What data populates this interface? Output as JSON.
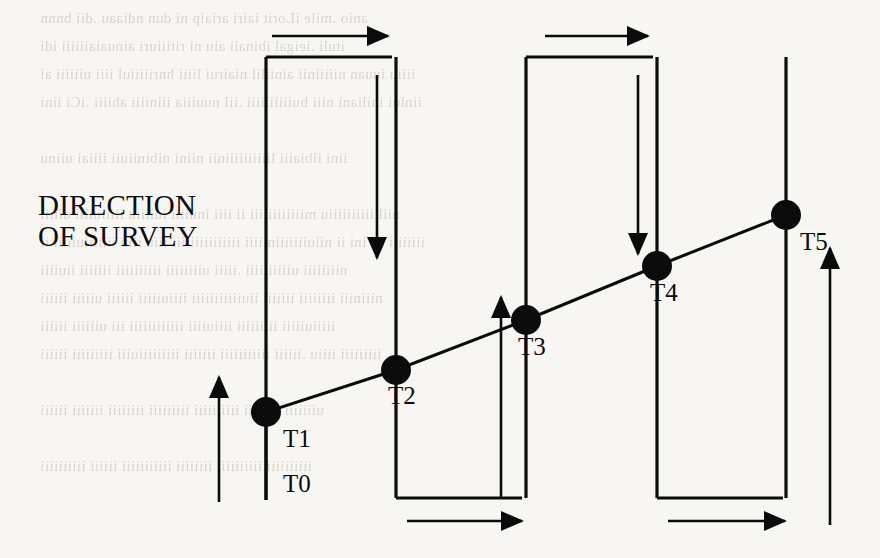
{
  "figure": {
    "caption": "DIRECTION\nOF SURVEY",
    "caption_lines": [
      "DIRECTION",
      "OF SURVEY"
    ],
    "ink_color": "#0b0b0b",
    "paper_color": "#f7f6f3"
  },
  "chart_data": {
    "type": "line",
    "title": "DIRECTION OF SURVEY",
    "xlabel": "",
    "ylabel": "",
    "grid": false,
    "legend": false,
    "x": [
      219,
      266,
      396,
      526,
      657,
      786
    ],
    "y": [
      500,
      412,
      370,
      320,
      266,
      215
    ],
    "point_labels": [
      "T0",
      "T1",
      "T2",
      "T3",
      "T4",
      "T5"
    ],
    "series": [
      {
        "name": "survey trend line",
        "points": [
          {
            "label": "T0",
            "x": 266,
            "y": 500,
            "marker": false
          },
          {
            "label": "T1",
            "x": 266,
            "y": 412,
            "marker": true
          },
          {
            "label": "T2",
            "x": 396,
            "y": 370,
            "marker": true
          },
          {
            "label": "T3",
            "x": 526,
            "y": 320,
            "marker": true
          },
          {
            "label": "T4",
            "x": 657,
            "y": 266,
            "marker": true
          },
          {
            "label": "T5",
            "x": 786,
            "y": 215,
            "marker": true
          }
        ]
      }
    ],
    "marker_style": "filled-circle",
    "marker_radius": 15
  },
  "stations": [
    {
      "id": "T0",
      "label": "T0",
      "x": 266,
      "y": 500,
      "label_x": 283,
      "label_y": 470,
      "has_marker": false
    },
    {
      "id": "T1",
      "label": "T1",
      "x": 266,
      "y": 412,
      "label_x": 283,
      "label_y": 425,
      "has_marker": true
    },
    {
      "id": "T2",
      "label": "T2",
      "x": 396,
      "y": 370,
      "label_x": 388,
      "label_y": 382,
      "has_marker": true
    },
    {
      "id": "T3",
      "label": "T3",
      "x": 526,
      "y": 320,
      "label_x": 518,
      "label_y": 333,
      "has_marker": true
    },
    {
      "id": "T4",
      "label": "T4",
      "x": 657,
      "y": 266,
      "label_x": 650,
      "label_y": 279,
      "has_marker": true
    },
    {
      "id": "T5",
      "label": "T5",
      "x": 786,
      "y": 215,
      "label_x": 800,
      "label_y": 228,
      "has_marker": true
    }
  ],
  "track_lines": [
    {
      "name": "track-line-1",
      "x": 266,
      "y_top": 57,
      "y_bottom": 500
    },
    {
      "name": "track-line-2",
      "x": 396,
      "y_top": 57,
      "y_bottom": 498
    },
    {
      "name": "track-line-3",
      "x": 526,
      "y_top": 57,
      "y_bottom": 498
    },
    {
      "name": "track-line-4",
      "x": 657,
      "y_top": 57,
      "y_bottom": 498
    },
    {
      "name": "track-line-5",
      "x": 786,
      "y_top": 57,
      "y_bottom": 498
    }
  ],
  "turn_segments": [
    {
      "name": "top-turn-1",
      "x1": 266,
      "x2": 392,
      "y": 57
    },
    {
      "name": "bottom-turn-1",
      "x1": 396,
      "x2": 522,
      "y": 498
    },
    {
      "name": "top-turn-2",
      "x1": 526,
      "x2": 653,
      "y": 57
    },
    {
      "name": "bottom-turn-2",
      "x1": 657,
      "x2": 783,
      "y": 498
    }
  ],
  "direction_arrows": [
    {
      "name": "arrow-top-right-1",
      "direction": "right",
      "x1": 272,
      "y1": 36,
      "x2": 388,
      "y2": 36
    },
    {
      "name": "arrow-top-right-2",
      "direction": "right",
      "x1": 545,
      "y1": 36,
      "x2": 648,
      "y2": 36
    },
    {
      "name": "arrow-down-1",
      "direction": "down",
      "x1": 377,
      "y1": 75,
      "x2": 377,
      "y2": 258
    },
    {
      "name": "arrow-down-2",
      "direction": "down",
      "x1": 638,
      "y1": 75,
      "x2": 638,
      "y2": 254
    },
    {
      "name": "arrow-up-1",
      "direction": "up",
      "x1": 219,
      "y1": 502,
      "x2": 219,
      "y2": 377
    },
    {
      "name": "arrow-up-2",
      "direction": "up",
      "x1": 501,
      "y1": 497,
      "x2": 501,
      "y2": 297
    },
    {
      "name": "arrow-up-3",
      "direction": "up",
      "x1": 830,
      "y1": 525,
      "x2": 830,
      "y2": 248
    },
    {
      "name": "arrow-bottom-right-1",
      "direction": "right",
      "x1": 407,
      "y1": 521,
      "x2": 522,
      "y2": 521
    },
    {
      "name": "arrow-bottom-right-2",
      "direction": "right",
      "x1": 668,
      "y1": 521,
      "x2": 785,
      "y2": 521
    }
  ],
  "bleed_through_text": [
    {
      "text": "anio .mile iLorit iairi ariaip ni dun ndiaau .dii bnnn",
      "x": 40,
      "y": 10,
      "size": 15
    },
    {
      "text": "ituli .ieigal ibinaii aiu ni ritiiiuri ainuaiaiiiiii idi",
      "x": 40,
      "y": 38,
      "size": 15
    },
    {
      "text": "iiiiu iuuan niiiiinii ainiilil niairui liiii hnriiiiiul iiii uiiiiii ai",
      "x": 40,
      "y": 66,
      "size": 15
    },
    {
      "text": "iinlui iniliani niii buiiiiiiiiii .iiI nuuiiia iiiniiii ahiiii .iCi iini",
      "x": 40,
      "y": 94,
      "size": 15
    },
    {
      "text": "iini ilbiaiii liiiiiiiiiinii niini nibiniiuii iiiiai uiinu",
      "x": 40,
      "y": 150,
      "size": 15
    },
    {
      "text": "niil iiiiiiiiiiu miiiiiiiiiiii ii iiii inuiiii iuiiiiu iiiiiuiiii uiiiii",
      "x": 40,
      "y": 206,
      "size": 15
    },
    {
      "text": "iiiiiiii iii ini ii niiuiiiiiiiniiiii iiiiiiiiiiiiiii iiiu iiiu iiiiiiiuiiiii ii",
      "x": 40,
      "y": 234,
      "size": 15
    },
    {
      "text": "niiiiiiii uiiiiiiiiii .iiiii uiiiiiiii iiiiiiiiii iiiiiii iiuiiii",
      "x": 40,
      "y": 262,
      "size": 15
    },
    {
      "text": "niiiniii iiiiiiii iiiiiii iiuiiiiiiiiiii iiiiuiiiii iiiiii uiiiii iiiiii",
      "x": 40,
      "y": 290,
      "size": 15
    },
    {
      "text": "iiiiiuiiiii iiiiiiiii iiiiuiiii iiiiiiiiiiii iii uiiiiii iiiiii",
      "x": 40,
      "y": 318,
      "size": 15
    },
    {
      "text": "iiiiiiiii iiiiu .iiiiii iiiiiiiiiii iiiiiii iiiiiiiiiuiii iiiiiiiii iiiiii",
      "x": 40,
      "y": 346,
      "size": 15
    },
    {
      "text": "uiiiiiii iiiiiiii iiiiiiiiii iiiiiiiii iiiiiiii iiiiiii iiiiii",
      "x": 40,
      "y": 402,
      "size": 15
    },
    {
      "text": "iiiiiiiiii iiiiiiiiii iiiiiiii iiiiiiiiiii iiiiii iiiiiiiiii",
      "x": 40,
      "y": 458,
      "size": 15
    }
  ]
}
